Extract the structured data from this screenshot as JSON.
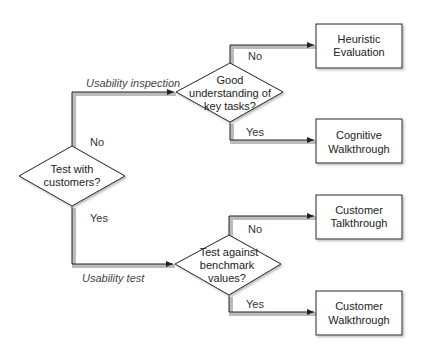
{
  "diagram": {
    "type": "flowchart",
    "decisions": [
      {
        "id": "d1",
        "lines": [
          "Test with",
          "customers?"
        ]
      },
      {
        "id": "d2",
        "lines": [
          "Good",
          "understanding of",
          "key tasks?"
        ]
      },
      {
        "id": "d3",
        "lines": [
          "Test against",
          "benchmark",
          "values?"
        ]
      }
    ],
    "outcomes": [
      {
        "id": "o1",
        "lines": [
          "Heuristic",
          "Evaluation"
        ]
      },
      {
        "id": "o2",
        "lines": [
          "Cognitive",
          "Walkthrough"
        ]
      },
      {
        "id": "o3",
        "lines": [
          "Customer",
          "Talkthrough"
        ]
      },
      {
        "id": "o4",
        "lines": [
          "Customer",
          "Walkthrough"
        ]
      }
    ],
    "edges": [
      {
        "from": "d1",
        "to": "d2",
        "branch": "No",
        "label": "Usability inspection"
      },
      {
        "from": "d1",
        "to": "d3",
        "branch": "Yes",
        "label": "Usability test"
      },
      {
        "from": "d2",
        "to": "o1",
        "branch": "No"
      },
      {
        "from": "d2",
        "to": "o2",
        "branch": "Yes"
      },
      {
        "from": "d3",
        "to": "o3",
        "branch": "No"
      },
      {
        "from": "d3",
        "to": "o4",
        "branch": "Yes"
      }
    ],
    "colors": {
      "stroke": "#222222",
      "shadow": "#bdbdbd",
      "fill": "#ffffff"
    }
  }
}
